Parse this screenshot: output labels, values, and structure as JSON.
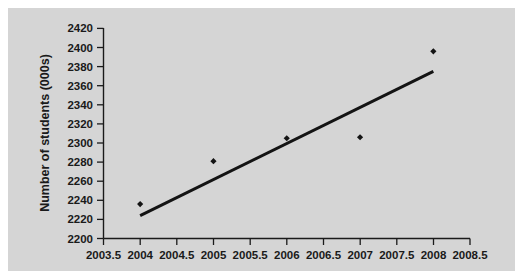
{
  "chart_data": {
    "type": "scatter",
    "title": "",
    "xlabel": "",
    "ylabel": "Number of students (000s)",
    "xlim": [
      2003.5,
      2008.5
    ],
    "ylim": [
      2200,
      2420
    ],
    "grid": false,
    "legend": "none",
    "x": [
      2004,
      2005,
      2006,
      2007,
      2008
    ],
    "values": [
      2236,
      2281,
      2305,
      2306,
      2396
    ],
    "points": [
      {
        "x": 2004,
        "y": 2236
      },
      {
        "x": 2005,
        "y": 2281
      },
      {
        "x": 2006,
        "y": 2305
      },
      {
        "x": 2007,
        "y": 2306
      },
      {
        "x": 2008,
        "y": 2396
      }
    ],
    "series": [
      {
        "name": "Number of students",
        "type": "scatter",
        "marker": "diamond",
        "color": "#141414",
        "values": [
          2236,
          2281,
          2305,
          2306,
          2396
        ]
      },
      {
        "name": "Trend line",
        "type": "line",
        "color": "#141414",
        "endpoints": [
          {
            "x": 2004.0,
            "y": 2224
          },
          {
            "x": 2008.0,
            "y": 2375
          }
        ]
      }
    ],
    "xticks": [
      2003.5,
      2004,
      2004.5,
      2005,
      2005.5,
      2006,
      2006.5,
      2007,
      2007.5,
      2008,
      2008.5
    ],
    "xticklabels": [
      "2003.5",
      "2004",
      "2004.5",
      "2005",
      "2005.5",
      "2006",
      "2006.5",
      "2007",
      "2007.5",
      "2008",
      "2008.5"
    ],
    "yticks": [
      2200,
      2220,
      2240,
      2260,
      2280,
      2300,
      2320,
      2340,
      2360,
      2380,
      2400,
      2420
    ],
    "yticklabels": [
      "2200",
      "2220",
      "2240",
      "2260",
      "2280",
      "2300",
      "2320",
      "2340",
      "2360",
      "2380",
      "2400",
      "2420"
    ]
  },
  "style": {
    "background": "#d5d5d5",
    "page_background": "#ffffff",
    "axis_color": "#1a1a1a",
    "data_color": "#141414"
  }
}
